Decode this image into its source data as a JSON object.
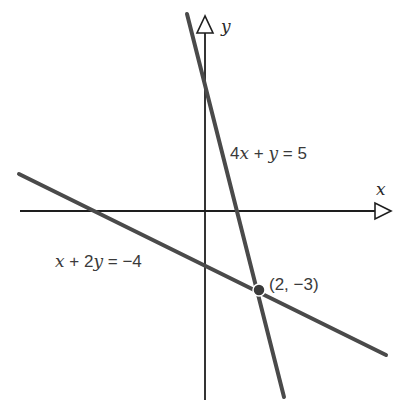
{
  "diagram": {
    "type": "coordinate-plane-system-of-equations",
    "axes": {
      "x_label": "x",
      "y_label": "y"
    },
    "lines": [
      {
        "equation_parts": [
          "4",
          "x",
          " + ",
          "y",
          " = 5"
        ],
        "equation": "4x + y = 5",
        "color": "#4a4a4a"
      },
      {
        "equation_parts": [
          "x",
          " + 2",
          "y",
          " = −4"
        ],
        "equation": "x + 2y = −4",
        "color": "#4a4a4a"
      }
    ],
    "intersection": {
      "label": "(2, −3)",
      "x": 2,
      "y": -3,
      "color": "#3a3a3a"
    }
  }
}
